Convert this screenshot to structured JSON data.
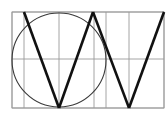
{
  "diagram": {
    "title": "",
    "colors": {
      "background": "#ffffff",
      "grid": "#9a9a9a",
      "circle": "#3a3a3a",
      "letter_strokes": "#111111"
    },
    "frame": {
      "x": 12,
      "y": 12,
      "width": 152,
      "height": 96
    },
    "grid": {
      "vertical_lines_x": [
        12,
        24,
        59,
        94,
        106,
        129,
        164
      ],
      "horizontal_lines_y": [
        12,
        59,
        108
      ]
    },
    "circle": {
      "cx": 59,
      "cy": 60,
      "r": 47
    },
    "letter": {
      "glyph": "W",
      "strokes": [
        {
          "name": "stroke-1",
          "points": [
            [
              24,
              12
            ],
            [
              59,
              108
            ]
          ]
        },
        {
          "name": "stroke-2",
          "points": [
            [
              59,
              108
            ],
            [
              93,
              12
            ]
          ]
        },
        {
          "name": "stroke-3",
          "points": [
            [
              93,
              12
            ],
            [
              129,
              108
            ]
          ]
        },
        {
          "name": "stroke-4",
          "points": [
            [
              129,
              108
            ],
            [
              164,
              12
            ]
          ]
        }
      ]
    }
  }
}
